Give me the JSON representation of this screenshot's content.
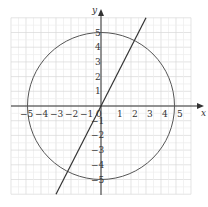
{
  "diagram": {
    "x_label": "x",
    "y_label": "y",
    "x_ticks": [
      "−5",
      "−4",
      "−3",
      "−2",
      "−1",
      "0",
      "1",
      "2",
      "3",
      "4",
      "5"
    ],
    "y_ticks": [
      "5",
      "4",
      "3",
      "2",
      "1",
      "−1",
      "−2",
      "−3",
      "−4",
      "−5"
    ],
    "circle": {
      "cx": 0,
      "cy": 0,
      "r": 5,
      "color": "#555555"
    },
    "line": {
      "slope": 2,
      "intercept": 0,
      "color": "#333333"
    },
    "grid_range": [
      -6,
      6
    ],
    "grid_color": "#dddddd"
  }
}
